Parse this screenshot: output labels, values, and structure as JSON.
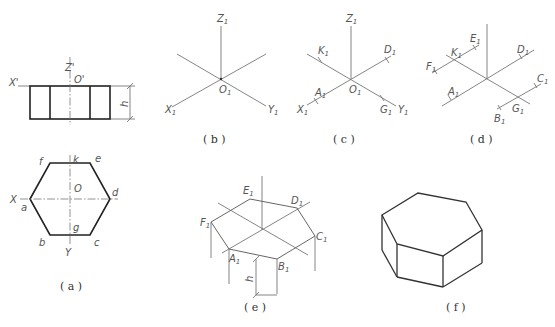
{
  "figure": {
    "panels": [
      {
        "id": "a",
        "caption": "( a )",
        "front_view": {
          "labels": {
            "x_axis": "X'",
            "z_axis": "Z'",
            "origin": "O'",
            "height": "h"
          }
        },
        "top_view": {
          "labels": {
            "x_axis": "X",
            "y_axis": "Y",
            "origin": "O",
            "a": "a",
            "b": "b",
            "c": "c",
            "d": "d",
            "e": "e",
            "f": "f",
            "g": "g",
            "k": "k"
          }
        }
      },
      {
        "id": "b",
        "caption": "( b )",
        "labels": {
          "z": "Z",
          "x": "X",
          "y": "Y",
          "o": "O",
          "sub": "1"
        }
      },
      {
        "id": "c",
        "caption": "( c )",
        "labels": {
          "z": "Z",
          "x": "X",
          "y": "Y",
          "o": "O",
          "k": "K",
          "d": "D",
          "a": "A",
          "g": "G",
          "sub": "1"
        }
      },
      {
        "id": "d",
        "caption": "( d )",
        "labels": {
          "e": "E",
          "k": "K",
          "f": "F",
          "d": "D",
          "a": "A",
          "c": "C",
          "g": "G",
          "b": "B",
          "sub": "1"
        }
      },
      {
        "id": "e",
        "caption": "( e )",
        "labels": {
          "e": "E",
          "d": "D",
          "f": "F",
          "c": "C",
          "a": "A",
          "b": "B",
          "h": "h",
          "sub": "1"
        }
      },
      {
        "id": "f",
        "caption": "( f )"
      }
    ]
  }
}
